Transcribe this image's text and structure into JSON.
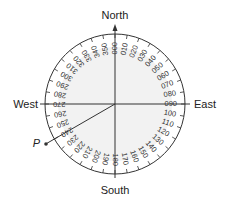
{
  "diagram": {
    "type": "compass-bearing",
    "labels": {
      "north": "North",
      "south": "South",
      "east": "East",
      "west": "West",
      "point": "P"
    },
    "bearings": [
      "000",
      "010",
      "020",
      "030",
      "040",
      "050",
      "060",
      "070",
      "080",
      "090",
      "100",
      "110",
      "120",
      "130",
      "140",
      "150",
      "160",
      "170",
      "180",
      "190",
      "200",
      "210",
      "220",
      "230",
      "240",
      "250",
      "260",
      "270",
      "280",
      "290",
      "300",
      "310",
      "320",
      "330",
      "340",
      "350"
    ],
    "point_bearing_deg": 240,
    "colors": {
      "line": "#333333",
      "dial_fill": "#f2f2f2",
      "text": "#222222"
    }
  }
}
